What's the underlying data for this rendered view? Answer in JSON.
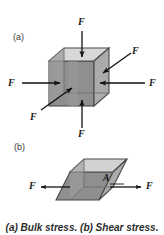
{
  "figure": {
    "caption": "(a) Bulk stress. (b) Shear stress.",
    "background_color": "#ffffff"
  },
  "panel_a": {
    "label": "(a)",
    "description": "cube-with-inward-normal-forces",
    "forces": [
      {
        "id": "top",
        "label": "F",
        "direction": "down"
      },
      {
        "id": "bottom",
        "label": "F",
        "direction": "up"
      },
      {
        "id": "left",
        "label": "F",
        "direction": "right"
      },
      {
        "id": "right",
        "label": "F",
        "direction": "left"
      },
      {
        "id": "front-lower-left",
        "label": "F",
        "direction": "up-right-diagonal"
      },
      {
        "id": "back-upper-right",
        "label": "F",
        "direction": "down-left-diagonal"
      }
    ],
    "colors": {
      "front_face": "#8c8c8c",
      "right_face": "#a8a8a8",
      "top_face": "#d6d6d6",
      "inner_face": "#9f9f9f",
      "edge": "#4a4a4a",
      "arrow": "#111111"
    }
  },
  "panel_b": {
    "label": "(b)",
    "description": "sheared-parallelepiped-with-area",
    "area_label": "A",
    "forces": [
      {
        "id": "left",
        "label": "F",
        "direction": "left"
      },
      {
        "id": "right",
        "label": "F",
        "direction": "right"
      }
    ],
    "colors": {
      "front_face": "#8c8c8c",
      "right_face": "#a8a8a8",
      "top_face": "#cfcfcf",
      "edge": "#4a4a4a",
      "arrow": "#111111"
    }
  }
}
